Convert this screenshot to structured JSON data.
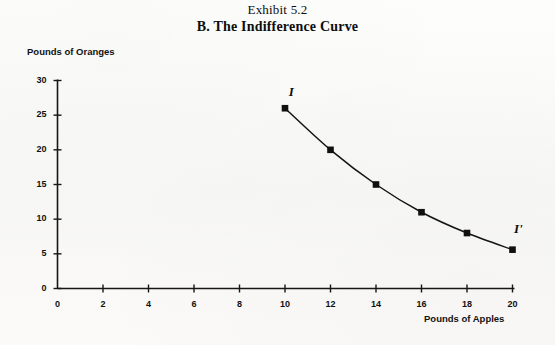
{
  "title": {
    "line1": "Exhibit 5.2",
    "line2": "B. The Indifference Curve"
  },
  "chart_data": {
    "type": "line",
    "title": "B. The Indifference Curve",
    "subtitle": "Exhibit 5.2",
    "xlabel": "Pounds of Apples",
    "ylabel": "Pounds of Oranges",
    "xlim": [
      0,
      20
    ],
    "ylim": [
      0,
      30
    ],
    "xticks": [
      "0",
      "2",
      "4",
      "6",
      "8",
      "10",
      "12",
      "14",
      "16",
      "18",
      "20"
    ],
    "yticks": [
      "0",
      "5",
      "10",
      "15",
      "20",
      "25",
      "30"
    ],
    "grid": false,
    "legend": "none",
    "marker": "filled-square",
    "line_color": "#111111",
    "series": [
      {
        "name": "I",
        "x": [
          10,
          12,
          14,
          16,
          18,
          20
        ],
        "values": [
          26,
          20,
          15,
          11,
          8,
          5.6
        ]
      }
    ],
    "annotations": [
      {
        "text": "I",
        "x": 10.3,
        "y": 28.2,
        "style": "italic"
      },
      {
        "text": "I'",
        "x": 20.2,
        "y": 8.4,
        "style": "italic"
      }
    ]
  }
}
